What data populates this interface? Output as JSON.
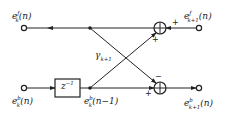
{
  "diagram": {
    "type": "lattice filter stage",
    "nodes": {
      "top_left": {
        "base": "e",
        "sup": "f",
        "sub": "k",
        "arg": "(n)"
      },
      "top_right": {
        "base": "e",
        "sup": "f",
        "sub": "k+1",
        "arg": "(n)"
      },
      "bottom_left": {
        "base": "e",
        "sup": "b",
        "sub": "k",
        "arg": "(n)"
      },
      "bottom_mid": {
        "base": "e",
        "sup": "b",
        "sub": "k",
        "arg": "(n−1)"
      },
      "bottom_right": {
        "base": "e",
        "sup": "b",
        "sub": "k+1",
        "arg": "(n)"
      }
    },
    "delay": {
      "base": "z",
      "sup": "−1"
    },
    "coefficient": {
      "base": "γ",
      "sub": "k+1"
    },
    "adder_top_signs": {
      "right": "+",
      "bottom": "+"
    },
    "adder_bottom_signs": {
      "top": "−",
      "left": "+"
    }
  }
}
